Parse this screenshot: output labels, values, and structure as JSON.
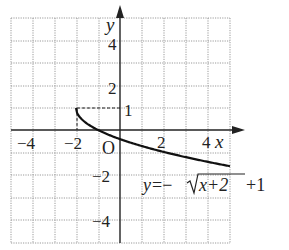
{
  "chart_data": {
    "type": "line",
    "title": "",
    "xlabel": "x",
    "ylabel": "y",
    "origin_label": "O",
    "xlim": [
      -5,
      5
    ],
    "ylim": [
      -5,
      5
    ],
    "grid": true,
    "grid_style": "dotted",
    "x_ticks": [
      {
        "value": -4,
        "label": "−4"
      },
      {
        "value": -2,
        "label": "−2"
      },
      {
        "value": 2,
        "label": "2"
      },
      {
        "value": 4,
        "label": "4"
      }
    ],
    "y_ticks": [
      {
        "value": 4,
        "label": "4"
      },
      {
        "value": 2,
        "label": "2"
      },
      {
        "value": 1,
        "label": "1"
      },
      {
        "value": -2,
        "label": "−2"
      },
      {
        "value": -4,
        "label": "−4"
      }
    ],
    "series": [
      {
        "name": "y = −√(x+2) + 1",
        "equation_label": "y=−√x+2+1",
        "start_point": [
          -2,
          1
        ],
        "x": [
          -2,
          -1.5,
          -1,
          0,
          1,
          2,
          3,
          4,
          5
        ],
        "y": [
          1,
          0.293,
          0,
          -0.414,
          -0.732,
          -1,
          -1.236,
          -1.449,
          -1.646
        ]
      }
    ],
    "annotations": [
      {
        "type": "dashed_line",
        "from": [
          -2,
          1
        ],
        "to": [
          0,
          1
        ]
      },
      {
        "type": "dashed_line",
        "from": [
          -2,
          1
        ],
        "to": [
          -2,
          0
        ]
      }
    ]
  },
  "labels": {
    "x_axis": "x",
    "y_axis": "y",
    "origin": "O",
    "eq_y": "y",
    "eq_eq": "=−",
    "eq_radicand": "x+2",
    "eq_tail": "+1",
    "tick_x_m4": "−4",
    "tick_x_m2": "−2",
    "tick_x_2": "2",
    "tick_x_4": "4",
    "tick_y_4": "4",
    "tick_y_2": "2",
    "tick_y_1": "1",
    "tick_y_m2": "−2",
    "tick_y_m4": "−4"
  }
}
